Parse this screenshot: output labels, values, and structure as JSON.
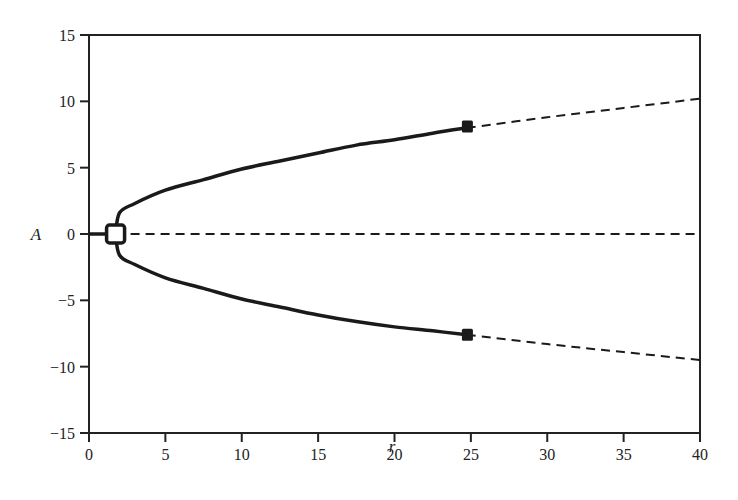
{
  "chart_data": {
    "type": "line",
    "title": "",
    "xlabel": "r",
    "ylabel": "A",
    "xlim": [
      0,
      40
    ],
    "ylim": [
      -15,
      15
    ],
    "x_ticks": [
      0,
      5,
      10,
      15,
      20,
      25,
      30,
      35,
      40
    ],
    "y_ticks": [
      15,
      10,
      5,
      0,
      -5,
      -10,
      -15
    ],
    "x_tick_labels": [
      "0",
      "5",
      "10",
      "15",
      "20",
      "25",
      "30",
      "35",
      "40"
    ],
    "y_tick_labels": [
      "15",
      "10",
      "5",
      "0",
      "−5",
      "−10",
      "−15"
    ],
    "grid": false,
    "legend": null,
    "series": [
      {
        "name": "trivial stable branch",
        "style": "solid",
        "x": [
          0,
          1.74
        ],
        "y": [
          0,
          0
        ]
      },
      {
        "name": "trivial unstable branch",
        "style": "dashed",
        "x": [
          1.74,
          40
        ],
        "y": [
          0,
          0
        ]
      },
      {
        "name": "upper stable branch",
        "style": "solid",
        "x": [
          1.74,
          2,
          3,
          5,
          7.5,
          10,
          12.5,
          15,
          17.5,
          20,
          22.5,
          24.74
        ],
        "y": [
          0,
          1.6,
          2.3,
          3.3,
          4.1,
          4.9,
          5.5,
          6.1,
          6.7,
          7.1,
          7.6,
          8.0
        ]
      },
      {
        "name": "upper unstable branch",
        "style": "dashed",
        "x": [
          24.74,
          30,
          35,
          40
        ],
        "y": [
          8.0,
          8.8,
          9.5,
          10.2
        ]
      },
      {
        "name": "lower stable branch",
        "style": "solid",
        "x": [
          1.74,
          2,
          3,
          5,
          7.5,
          10,
          12.5,
          15,
          17.5,
          20,
          22.5,
          24.74
        ],
        "y": [
          0,
          -1.6,
          -2.3,
          -3.3,
          -4.1,
          -4.9,
          -5.5,
          -6.1,
          -6.6,
          -7.0,
          -7.3,
          -7.6
        ]
      },
      {
        "name": "lower unstable branch",
        "style": "dashed",
        "x": [
          24.74,
          30,
          35,
          40
        ],
        "y": [
          -7.6,
          -8.3,
          -8.9,
          -9.5
        ]
      }
    ],
    "markers": [
      {
        "type": "open-square",
        "label": "pitchfork bifurcation",
        "x": 1.74,
        "y": 0
      },
      {
        "type": "filled-square",
        "label": "Hopf bifurcation (upper)",
        "x": 24.74,
        "y": 8.1
      },
      {
        "type": "filled-square",
        "label": "Hopf bifurcation (lower)",
        "x": 24.74,
        "y": -7.6
      }
    ]
  }
}
